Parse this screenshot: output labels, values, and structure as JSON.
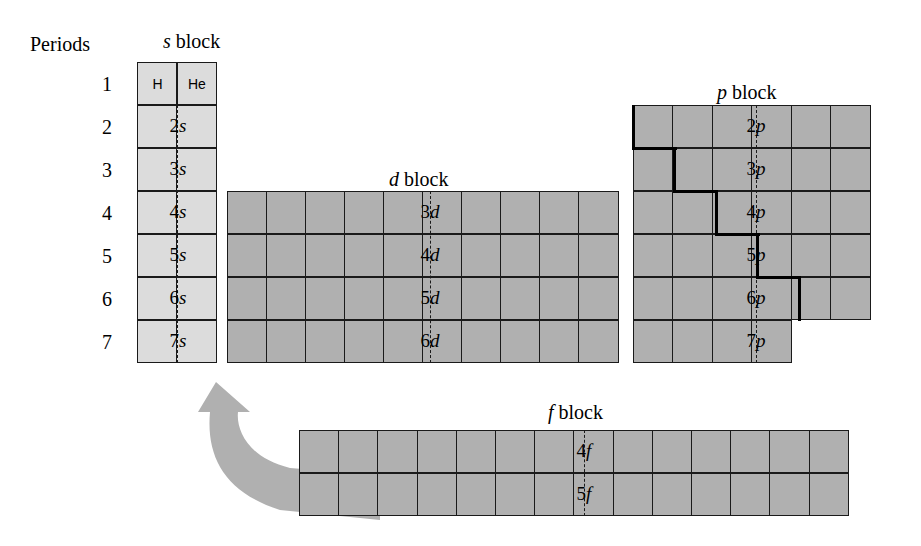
{
  "figure": {
    "type": "periodic-table-blocks-diagram",
    "periods_label": "Periods",
    "period_numbers": [
      "1",
      "2",
      "3",
      "4",
      "5",
      "6",
      "7"
    ],
    "colors": {
      "s_block_fill": "#dcdcdc",
      "d_block_fill": "#b0b0b0",
      "p_block_fill": "#b0b0b0",
      "f_block_fill": "#b0b0b0",
      "grid_line": "#1a1a1a",
      "staircase_line": "#000000",
      "arrow_fill": "#b0b0b0",
      "background": "#ffffff"
    }
  },
  "blocks": {
    "s": {
      "title_prefix": "s",
      "title_suffix": " block",
      "columns": 2,
      "rows": 7,
      "row_labels": [
        "",
        "2s",
        "3s",
        "4s",
        "5s",
        "6s",
        "7s"
      ],
      "first_row_cells": [
        "H",
        "He"
      ],
      "orbital_labels": [
        {
          "n": "2",
          "orbital": "s"
        },
        {
          "n": "3",
          "orbital": "s"
        },
        {
          "n": "4",
          "orbital": "s"
        },
        {
          "n": "5",
          "orbital": "s"
        },
        {
          "n": "6",
          "orbital": "s"
        },
        {
          "n": "7",
          "orbital": "s"
        }
      ]
    },
    "d": {
      "title_prefix": "d",
      "title_suffix": " block",
      "columns": 10,
      "rows": 4,
      "row_labels": [
        "3d",
        "4d",
        "5d",
        "6d"
      ],
      "orbital_labels": [
        {
          "n": "3",
          "orbital": "d"
        },
        {
          "n": "4",
          "orbital": "d"
        },
        {
          "n": "5",
          "orbital": "d"
        },
        {
          "n": "6",
          "orbital": "d"
        }
      ],
      "period_span": [
        "4",
        "5",
        "6",
        "7"
      ]
    },
    "p": {
      "title_prefix": "p",
      "title_suffix": " block",
      "columns": 6,
      "rows": 6,
      "row_labels": [
        "2p",
        "3p",
        "4p",
        "5p",
        "6p",
        "7p"
      ],
      "orbital_labels": [
        {
          "n": "2",
          "orbital": "p"
        },
        {
          "n": "3",
          "orbital": "p"
        },
        {
          "n": "4",
          "orbital": "p"
        },
        {
          "n": "5",
          "orbital": "p"
        },
        {
          "n": "6",
          "orbital": "p"
        },
        {
          "n": "7",
          "orbital": "p"
        }
      ],
      "row_cell_counts": [
        6,
        6,
        6,
        6,
        6,
        4
      ],
      "period_span": [
        "2",
        "3",
        "4",
        "5",
        "6",
        "7"
      ]
    },
    "f": {
      "title_prefix": "f",
      "title_suffix": " block",
      "columns": 14,
      "rows": 2,
      "row_labels": [
        "4f",
        "5f"
      ],
      "orbital_labels": [
        {
          "n": "4",
          "orbital": "f"
        },
        {
          "n": "5",
          "orbital": "f"
        }
      ]
    }
  },
  "annotations": {
    "staircase_description": "heavy stepped metalloid dividing line across the p block",
    "arrow_description": "curved gray arrow from the f block up to the s block"
  }
}
